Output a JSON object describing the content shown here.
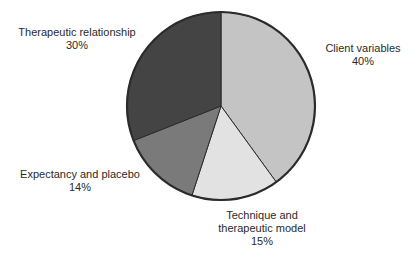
{
  "chart_data": {
    "type": "pie",
    "title": "",
    "start_angle_deg": 0,
    "direction": "clockwise",
    "categories": [
      "Client variables",
      "Technique and therapeutic model",
      "Expectancy and placebo",
      "Therapeutic relationship"
    ],
    "values": [
      40,
      15,
      14,
      30
    ],
    "unit": "%",
    "colors": [
      "#c4c4c4",
      "#e2e2e2",
      "#7a7a7a",
      "#444444"
    ],
    "edge_color": "#2b2b2b",
    "legend": "none (labels placed outside slices)",
    "slices": [
      {
        "label": "Client variables",
        "value": 40,
        "display": "40%",
        "color": "#c4c4c4"
      },
      {
        "label": "Technique and therapeutic model",
        "value": 15,
        "display": "15%",
        "color": "#e2e2e2"
      },
      {
        "label": "Expectancy and placebo",
        "value": 14,
        "display": "14%",
        "color": "#7a7a7a"
      },
      {
        "label": "Therapeutic relationship",
        "value": 30,
        "display": "30%",
        "color": "#444444"
      }
    ]
  },
  "labels": {
    "client": {
      "line1": "Client variables",
      "pct": "40%"
    },
    "technique": {
      "line1": "Technique and",
      "line2": "therapeutic model",
      "pct": "15%"
    },
    "expectancy": {
      "line1": "Expectancy and placebo",
      "pct": "14%"
    },
    "relationship": {
      "line1": "Therapeutic relationship",
      "pct": "30%"
    }
  }
}
